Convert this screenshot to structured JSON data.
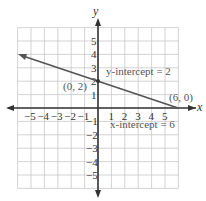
{
  "chart_data": {
    "type": "line",
    "title": "",
    "xlabel": "x",
    "ylabel": "y",
    "xlim": [
      -6,
      6
    ],
    "ylim": [
      -6,
      6
    ],
    "grid": true,
    "x_ticks": [
      "-5",
      "-4",
      "-3",
      "-2",
      "-1",
      "1",
      "2",
      "3",
      "4",
      "5"
    ],
    "y_ticks": [
      "5",
      "4",
      "3",
      "2",
      "1",
      "-1",
      "-2",
      "-3",
      "-4",
      "-5"
    ],
    "series": [
      {
        "name": "line",
        "x": [
          -6,
          0,
          6
        ],
        "y": [
          4,
          2,
          0
        ],
        "color": "#555555"
      }
    ],
    "points": [
      {
        "label": "(0, 2)",
        "x": 0,
        "y": 2
      },
      {
        "label": "(6, 0)",
        "x": 6,
        "y": 0
      }
    ],
    "annotations": [
      {
        "text": "y-intercept = 2"
      },
      {
        "text": "x-intercept = 6"
      }
    ]
  }
}
